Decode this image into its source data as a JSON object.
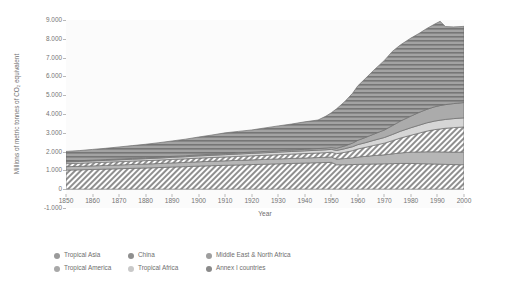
{
  "chart_data": {
    "type": "area",
    "stacked": true,
    "title": "",
    "xlabel": "Year",
    "ylabel": "Millions of metric tonnes of CO₂ equivalent",
    "xlim": [
      1850,
      2000
    ],
    "ylim": [
      -1000,
      9000
    ],
    "grid": false,
    "legend_position": "bottom",
    "ytick_labels": [
      "9.000",
      "8.000",
      "7.000",
      "6.000",
      "5.000",
      "4.000",
      "3.000",
      "2.000",
      "1.000",
      "0",
      "-1.000"
    ],
    "ytick_values": [
      9000,
      8000,
      7000,
      6000,
      5000,
      4000,
      3000,
      2000,
      1000,
      0,
      -1000
    ],
    "xtick_labels": [
      "1850",
      "1860",
      "1870",
      "1880",
      "1890",
      "1900",
      "1910",
      "1920",
      "1930",
      "1940",
      "1950",
      "1960",
      "1970",
      "1980",
      "1990",
      "2000"
    ],
    "xtick_values": [
      1850,
      1860,
      1870,
      1880,
      1890,
      1900,
      1910,
      1920,
      1930,
      1940,
      1950,
      1960,
      1970,
      1980,
      1990,
      2000
    ],
    "x": [
      1850,
      1855,
      1860,
      1865,
      1870,
      1875,
      1880,
      1885,
      1890,
      1895,
      1900,
      1905,
      1910,
      1915,
      1920,
      1925,
      1930,
      1935,
      1940,
      1945,
      1948,
      1950,
      1952,
      1955,
      1958,
      1960,
      1963,
      1966,
      1970,
      1973,
      1976,
      1980,
      1983,
      1986,
      1989,
      1991,
      1993,
      1996,
      2000
    ],
    "series": [
      {
        "name": "Tropical Asia",
        "color": "#9a9a9a",
        "pattern": "diagonal-hatch",
        "values": [
          1020,
          1030,
          1050,
          1070,
          1090,
          1110,
          1130,
          1150,
          1180,
          1200,
          1230,
          1250,
          1270,
          1290,
          1310,
          1330,
          1350,
          1370,
          1390,
          1410,
          1420,
          1430,
          1300,
          1300,
          1310,
          1320,
          1330,
          1340,
          1350,
          1360,
          1370,
          1370,
          1360,
          1350,
          1340,
          1330,
          1320,
          1310,
          1300
        ]
      },
      {
        "name": "Tropical America",
        "color": "#a8a8a8",
        "pattern": "solid-light",
        "values": [
          180,
          185,
          190,
          195,
          200,
          205,
          210,
          215,
          220,
          225,
          230,
          235,
          240,
          245,
          250,
          255,
          260,
          265,
          270,
          275,
          280,
          285,
          300,
          330,
          360,
          390,
          420,
          450,
          480,
          520,
          560,
          600,
          620,
          640,
          650,
          655,
          660,
          665,
          670
        ]
      },
      {
        "name": "China",
        "color": "#8f8f8f",
        "pattern": "diagonal-hatch",
        "values": [
          160,
          165,
          170,
          172,
          175,
          178,
          180,
          183,
          186,
          190,
          195,
          200,
          205,
          210,
          215,
          220,
          225,
          230,
          235,
          240,
          245,
          250,
          290,
          330,
          380,
          430,
          480,
          540,
          620,
          700,
          790,
          900,
          1000,
          1100,
          1180,
          1220,
          1260,
          1300,
          1340
        ]
      },
      {
        "name": "Tropical Africa",
        "color": "#c9c9c9",
        "pattern": "solid-pale",
        "values": [
          90,
          92,
          94,
          96,
          98,
          100,
          103,
          106,
          109,
          112,
          115,
          118,
          122,
          126,
          130,
          134,
          138,
          142,
          146,
          150,
          153,
          155,
          170,
          190,
          210,
          230,
          250,
          270,
          300,
          330,
          360,
          400,
          420,
          440,
          455,
          465,
          470,
          478,
          485
        ]
      },
      {
        "name": "Middle East & North Africa",
        "color": "#9e9e9e",
        "pattern": "solid-mid",
        "values": [
          40,
          41,
          42,
          43,
          44,
          45,
          47,
          49,
          51,
          53,
          55,
          58,
          61,
          64,
          67,
          70,
          74,
          78,
          82,
          86,
          90,
          95,
          120,
          150,
          190,
          230,
          280,
          330,
          400,
          470,
          540,
          620,
          680,
          720,
          760,
          780,
          790,
          800,
          815
        ]
      },
      {
        "name": "Annex I countries",
        "color": "#8a8a8a",
        "pattern": "horizontal-hatch",
        "values": [
          520,
          540,
          570,
          600,
          640,
          680,
          720,
          770,
          820,
          880,
          950,
          1020,
          1100,
          1140,
          1180,
          1250,
          1320,
          1380,
          1460,
          1520,
          1700,
          1850,
          2100,
          2350,
          2650,
          2900,
          3150,
          3400,
          3700,
          3950,
          4050,
          4150,
          4200,
          4300,
          4400,
          4480,
          4150,
          4080,
          4050
        ]
      }
    ]
  },
  "legend": {
    "items": [
      {
        "label": "Tropical Asia",
        "color": "#9a9a9a"
      },
      {
        "label": "China",
        "color": "#8f8f8f"
      },
      {
        "label": "Middle East & North Africa",
        "color": "#9e9e9e"
      },
      {
        "label": "Tropical America",
        "color": "#a8a8a8"
      },
      {
        "label": "Tropical Africa",
        "color": "#c9c9c9"
      },
      {
        "label": "Annex I countries",
        "color": "#8a8a8a"
      }
    ]
  }
}
